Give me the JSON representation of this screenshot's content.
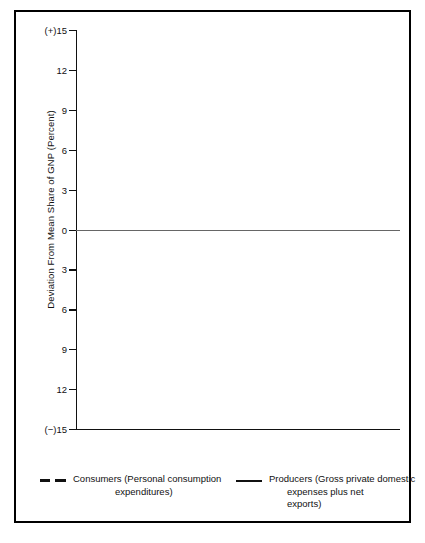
{
  "axes": {
    "ylabel": "Deviation From Mean Share of GNP (Percent)",
    "yticks": [
      "(+)15",
      "12",
      "9",
      "6",
      "3",
      "0",
      "3",
      "6",
      "9",
      "12",
      "(−)15"
    ],
    "xticks": [
      "1951",
      "1954",
      "1957",
      "1960",
      "1963",
      "1966",
      "1969",
      "1972",
      "1975",
      "1978",
      "1981"
    ]
  },
  "legend": {
    "consumers": {
      "name": "Consumers (Personal consumption",
      "cont": "expenditures)",
      "style": "dashed"
    },
    "producers": {
      "name": "Producers (Gross private domestic",
      "cont": "expenses plus net",
      "cont2": "exports)",
      "style": "solid"
    }
  },
  "colors": {
    "line": "#111111",
    "zero_line": "#666666",
    "frame": "#000000",
    "background": "#ffffff"
  },
  "chart_data": {
    "type": "line",
    "title": "",
    "xlabel": "",
    "ylabel": "Deviation From Mean Share of GNP (Percent)",
    "xlim": [
      1951,
      1981
    ],
    "ylim": [
      -15,
      15
    ],
    "ytick_values": [
      15,
      12,
      9,
      6,
      3,
      0,
      -3,
      -6,
      -9,
      -12,
      -15
    ],
    "ytick_labels": [
      "(+)15",
      "12",
      "9",
      "6",
      "3",
      "0",
      "3",
      "6",
      "9",
      "12",
      "(−)15"
    ],
    "xtick_values": [
      1951,
      1954,
      1957,
      1960,
      1963,
      1966,
      1969,
      1972,
      1975,
      1978,
      1981
    ],
    "grid": false,
    "legend_position": "below",
    "series": [
      {
        "name": "Producers (Gross private domestic expenses plus net exports)",
        "style": "solid",
        "x": [
          1951,
          1954,
          1957,
          1960,
          1963,
          1966,
          1969,
          1972,
          1975,
          1978,
          1981
        ],
        "values": [
          15.0,
          -8.7,
          3.7,
          -3.0,
          -0.3,
          5.4,
          -1.4,
          -1.2,
          -8.7,
          4.3,
          2.6
        ]
      },
      {
        "name": "Consumers (Personal consumption expenditures)",
        "style": "dashed",
        "x": [
          1951,
          1952,
          1953,
          1955,
          1957,
          1958,
          1960,
          1963,
          1965,
          1969,
          1973,
          1975,
          1978,
          1981
        ],
        "values": [
          -0.4,
          1.4,
          2.1,
          0.4,
          1.4,
          2.0,
          1.0,
          0.0,
          -2.0,
          -1.4,
          0.2,
          -0.3,
          0.2,
          1.5
        ]
      }
    ]
  }
}
